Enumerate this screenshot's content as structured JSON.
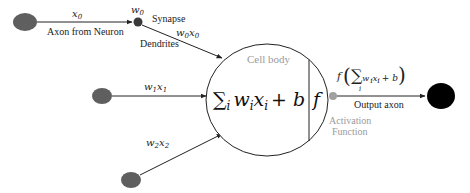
{
  "diagram": {
    "type": "artificial-neuron",
    "labels": {
      "x0": "x",
      "x0_sub": "0",
      "axon_from_neuron": "Axon from Neuron",
      "w0": "w",
      "w0_sub": "0",
      "synapse": "Synapse",
      "w0x0_w": "w",
      "w0x0_wsub": "0",
      "w0x0_x": "x",
      "w0x0_xsub": "0",
      "dendrites": "Dendrites",
      "w1x1_w": "w",
      "w1x1_wsub": "1",
      "w1x1_x": "x",
      "w1x1_xsub": "1",
      "w2x2_w": "w",
      "w2x2_wsub": "2",
      "w2x2_x": "x",
      "w2x2_xsub": "2",
      "cell_body": "Cell body",
      "sum_sigma": "∑",
      "sum_i": "i",
      "sum_expr_w": "w",
      "sum_expr_x": "x",
      "sum_expr_sub": "i",
      "sum_plus_b": "+ b",
      "activation_f": "f",
      "output_f": "f",
      "output_open": "(",
      "output_sigma": "∑",
      "output_sigma_sub": "i",
      "output_w": "w",
      "output_x": "x",
      "output_sub": "i",
      "output_plus_b": "+ b",
      "output_close": ")",
      "output_axon": "Output axon",
      "activation_line1": "Activation",
      "activation_line2": "Function"
    },
    "colors": {
      "input_node": "#5f5f5f",
      "synapse_node": "#3a3a3a",
      "activation_node": "#a0a0a0",
      "output_node": "#000000",
      "line": "#222222",
      "muted_text": "#9a9a9a"
    }
  }
}
